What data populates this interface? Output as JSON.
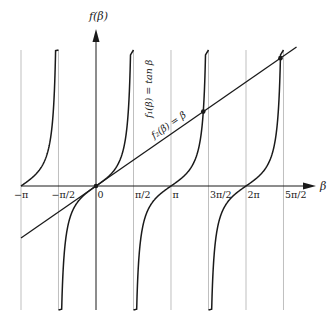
{
  "diagram": {
    "y_axis_label": "f(β)",
    "x_axis_label": "β",
    "tick_labels": [
      {
        "text": "−π",
        "value": -3.14159
      },
      {
        "text": "−π/2",
        "value": -1.5708
      },
      {
        "text": "0",
        "value": 0
      },
      {
        "text": "π/2",
        "value": 1.5708
      },
      {
        "text": "π",
        "value": 3.14159
      },
      {
        "text": "3π/2",
        "value": 4.7124
      },
      {
        "text": "2π",
        "value": 6.28319
      },
      {
        "text": "5π/2",
        "value": 7.85398
      }
    ],
    "curves": [
      {
        "name": "f1",
        "label": "f₁(β) = tan β",
        "expression": "tan β"
      },
      {
        "name": "f2",
        "label": "f₂(β) = β",
        "expression": "β"
      }
    ],
    "intersections_marked": [
      {
        "beta": 0,
        "value": 0
      },
      {
        "beta": 4.4934,
        "value": 4.4934
      },
      {
        "beta": 7.7253,
        "value": 7.7253
      }
    ],
    "colors": {
      "curve": "#1a1a1a",
      "grid": "#b8b8b8",
      "axis": "#1a1a1a",
      "background": "#ffffff"
    }
  }
}
